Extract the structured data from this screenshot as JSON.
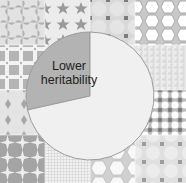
{
  "chart_data": {
    "type": "pie",
    "title": "",
    "slices": [
      {
        "label": "Lower heritability",
        "value": 28.5,
        "color": "#b3b3b3"
      },
      {
        "label": "",
        "value": 71.5,
        "color": "#f0f0f0"
      }
    ],
    "start_angle_deg": 0,
    "direction": "counterclockwise-from-top for labeled slice",
    "legend": "none",
    "background": "4x4 grid of decorative patterned tiles"
  },
  "labels": {
    "slice_1_line1": "Lower",
    "slice_1_line2": "heritability"
  },
  "colors": {
    "slice_dark": "#b3b3b3",
    "slice_light": "#f0f0f0",
    "pattern_dark": "#9a9a9a",
    "pattern_mid": "#c4c4c4",
    "pattern_light": "#e6e6e6",
    "outline": "#9c9c9c"
  }
}
